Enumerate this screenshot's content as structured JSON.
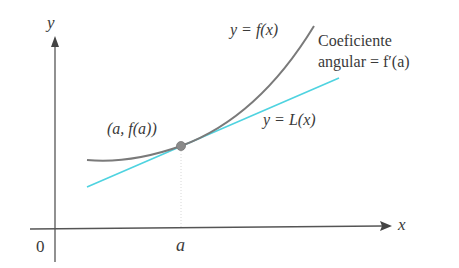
{
  "diagram": {
    "type": "tangent-line-approximation",
    "axes": {
      "x_label": "x",
      "y_label": "y",
      "origin_label": "0",
      "tick_label": "a"
    },
    "curve": {
      "label": "y = f(x)",
      "color": "#7a7a7a"
    },
    "tangent": {
      "label": "y = L(x)",
      "color": "#4fd3e0"
    },
    "point": {
      "label": "(a, f(a))",
      "color": "#8a8a8a"
    },
    "slope_note": {
      "line1": "Coeficiente",
      "line2": "angular = f′(a)"
    }
  }
}
